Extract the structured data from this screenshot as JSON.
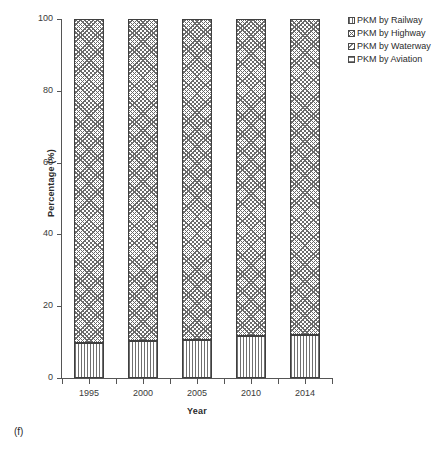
{
  "panel_caption": "(f)",
  "axes": {
    "y_title": "Percentage (%)",
    "x_title": "Year",
    "y_ticks": [
      "0",
      "20",
      "40",
      "60",
      "80",
      "100"
    ],
    "x_ticks": [
      "1995",
      "2000",
      "2005",
      "2010",
      "2014"
    ]
  },
  "legend": {
    "items": [
      {
        "label": "PKM by Railway",
        "pattern": "vertical-lines"
      },
      {
        "label": "PKM by Highway",
        "pattern": "cross-hatch"
      },
      {
        "label": "PKM by Waterway",
        "pattern": "diagonal-lines"
      },
      {
        "label": "PKM by Aviation",
        "pattern": "horizontal-lines"
      }
    ]
  },
  "chart_data": {
    "type": "bar",
    "subtype": "stacked-percentage",
    "title": "",
    "xlabel": "Year",
    "ylabel": "Percentage (%)",
    "categories": [
      "1995",
      "2000",
      "2005",
      "2010",
      "2014"
    ],
    "ylim": [
      0,
      100
    ],
    "yticks": [
      0,
      20,
      40,
      60,
      80,
      100
    ],
    "grid": false,
    "legend_position": "top-right",
    "series": [
      {
        "name": "PKM by Railway",
        "values": [
          9.8,
          10.3,
          10.7,
          11.7,
          12.1
        ]
      },
      {
        "name": "PKM by Highway",
        "values": [
          90.2,
          89.7,
          89.3,
          88.3,
          87.9
        ]
      },
      {
        "name": "PKM by Waterway",
        "values": [
          0,
          0,
          0,
          0,
          0
        ]
      },
      {
        "name": "PKM by Aviation",
        "values": [
          0,
          0,
          0,
          0,
          0
        ]
      }
    ]
  }
}
